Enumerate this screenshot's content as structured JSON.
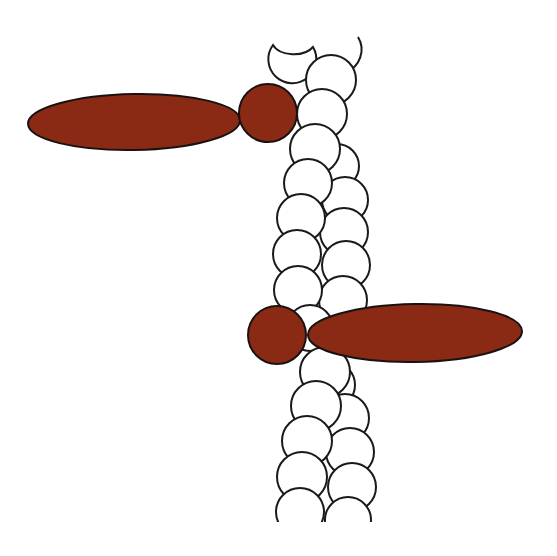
{
  "diagram": {
    "description": "Filament of white spherical subunits in a double-helical twist, with two brown globular heads (circle + elongated ellipse) bound on opposite sides",
    "colors": {
      "background": "#ffffff",
      "subunit_fill": "#ffffff",
      "outline": "#1a1a1a",
      "head_fill": "#8b2a14"
    },
    "filament": {
      "strands": 2,
      "subunit_shape": "circle"
    },
    "heads": [
      {
        "side": "left",
        "position": "upper",
        "circle": {
          "cx": 268,
          "cy": 113,
          "r": 29
        },
        "ellipse": {
          "cx": 134,
          "cy": 122,
          "rx": 106,
          "ry": 28,
          "rotate": -1
        }
      },
      {
        "side": "right",
        "position": "lower",
        "circle": {
          "cx": 277,
          "cy": 335,
          "r": 29
        },
        "ellipse": {
          "cx": 415,
          "cy": 333,
          "rx": 107,
          "ry": 29,
          "rotate": -1
        }
      }
    ]
  }
}
